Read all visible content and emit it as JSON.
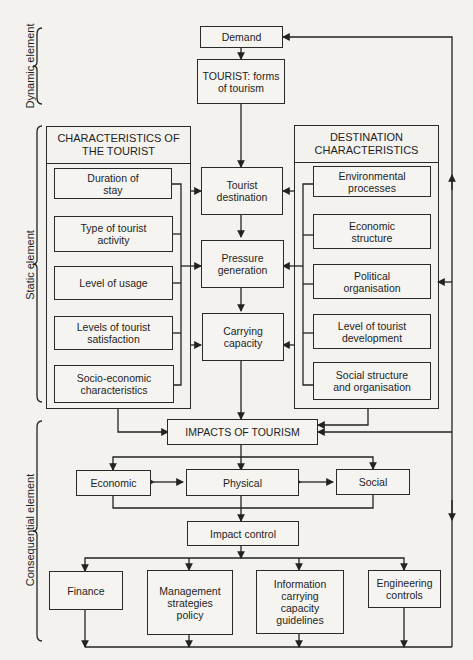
{
  "side_labels": {
    "dynamic": "Dynamic element",
    "static": "Static element",
    "consequential": "Consequential element"
  },
  "nodes": {
    "demand": "Demand",
    "tourist_forms": "TOURIST: forms\nof tourism",
    "tourist_destination": "Tourist\ndestination",
    "pressure_generation": "Pressure\ngeneration",
    "carrying_capacity": "Carrying\ncapacity",
    "impacts": "IMPACTS OF TOURISM",
    "economic": "Economic",
    "physical": "Physical",
    "social": "Social",
    "impact_control": "Impact control",
    "finance": "Finance",
    "management": "Management\nstrategies\npolicy",
    "information": "Information\ncarrying\ncapacity\nguidelines",
    "engineering": "Engineering\ncontrols"
  },
  "tourist_characteristics": {
    "title": "CHARACTERISTICS OF\nTHE TOURIST",
    "items": [
      "Duration of\nstay",
      "Type of tourist\nactivity",
      "Level of usage",
      "Levels of tourist\nsatisfaction",
      "Socio-economic\ncharacteristics"
    ]
  },
  "destination_characteristics": {
    "title": "DESTINATION\nCHARACTERISTICS",
    "items": [
      "Environmental\nprocesses",
      "Economic\nstructure",
      "Political\norganisation",
      "Level of tourist\ndevelopment",
      "Social structure\nand organisation"
    ]
  }
}
